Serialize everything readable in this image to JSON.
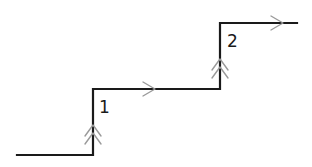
{
  "diagram": {
    "type": "step-path",
    "colors": {
      "line": "#1a1a1a",
      "arrows": "#9a9a9a",
      "background": "#ffffff"
    },
    "labels": [
      {
        "id": "step-1",
        "text": "1"
      },
      {
        "id": "step-2",
        "text": "2"
      }
    ],
    "segments": [
      {
        "name": "lower-horizontal",
        "direction": "right"
      },
      {
        "name": "rise-1",
        "direction": "up",
        "arrow": "double-chevron"
      },
      {
        "name": "middle-horizontal",
        "direction": "right",
        "arrow": "single-chevron"
      },
      {
        "name": "rise-2",
        "direction": "up",
        "arrow": "double-chevron"
      },
      {
        "name": "upper-horizontal",
        "direction": "right",
        "arrow": "single-chevron"
      }
    ]
  }
}
